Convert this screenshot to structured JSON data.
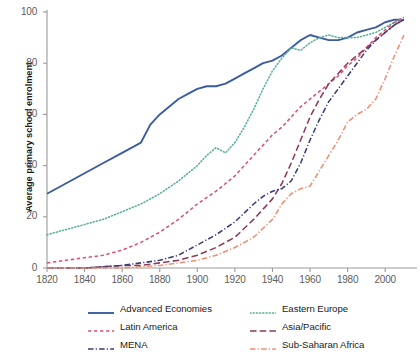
{
  "chart_data": {
    "type": "line",
    "title": "",
    "xlabel": "",
    "ylabel": "Average primary school enrolment",
    "xlim": [
      1820,
      2010
    ],
    "ylim": [
      0,
      100
    ],
    "grid": false,
    "legend_position": "bottom",
    "xticks": [
      "1820",
      "1840",
      "1860",
      "1880",
      "1900",
      "1920",
      "1940",
      "1960",
      "1980",
      "2000"
    ],
    "xtick_values": [
      1820,
      1840,
      1860,
      1880,
      1900,
      1920,
      1940,
      1960,
      1980,
      2000
    ],
    "yticks": [
      "0",
      "20",
      "40",
      "60",
      "80",
      "100"
    ],
    "ytick_values": [
      0,
      20,
      40,
      60,
      80,
      100
    ],
    "series": [
      {
        "name": "Advanced Economies",
        "color": "#3b5c9e",
        "style": "solid",
        "x": [
          1820,
          1830,
          1840,
          1850,
          1860,
          1870,
          1875,
          1880,
          1885,
          1890,
          1895,
          1900,
          1905,
          1910,
          1915,
          1920,
          1925,
          1930,
          1935,
          1940,
          1945,
          1950,
          1955,
          1960,
          1965,
          1970,
          1975,
          1980,
          1985,
          1990,
          1995,
          2000,
          2005,
          2010
        ],
        "values": [
          29,
          33,
          37,
          41,
          45,
          49,
          56,
          60,
          63,
          66,
          68,
          70,
          71,
          71,
          72,
          74,
          76,
          78,
          80,
          81,
          83,
          86,
          89,
          91,
          90,
          89,
          89,
          90,
          92,
          93,
          94,
          96,
          97,
          97
        ]
      },
      {
        "name": "Eastern Europe",
        "color": "#58b09c",
        "style": "dotted",
        "x": [
          1820,
          1830,
          1840,
          1850,
          1860,
          1870,
          1880,
          1890,
          1900,
          1905,
          1910,
          1915,
          1920,
          1925,
          1930,
          1935,
          1940,
          1945,
          1950,
          1955,
          1960,
          1965,
          1970,
          1975,
          1980,
          1985,
          1990,
          1995,
          2000,
          2005,
          2010
        ],
        "values": [
          13,
          15,
          17,
          19,
          22,
          25,
          29,
          34,
          40,
          44,
          47,
          45,
          49,
          55,
          62,
          70,
          77,
          82,
          86,
          85,
          88,
          90,
          91,
          90,
          90,
          90,
          91,
          92,
          94,
          96,
          97
        ]
      },
      {
        "name": "Latin America",
        "color": "#d9536f",
        "style": "dashed",
        "x": [
          1820,
          1830,
          1840,
          1850,
          1860,
          1870,
          1880,
          1890,
          1900,
          1910,
          1920,
          1925,
          1930,
          1935,
          1940,
          1945,
          1950,
          1955,
          1960,
          1965,
          1970,
          1975,
          1980,
          1985,
          1990,
          1995,
          2000,
          2005,
          2010
        ],
        "values": [
          2,
          3,
          4,
          5,
          7,
          10,
          14,
          19,
          25,
          30,
          36,
          40,
          44,
          48,
          52,
          55,
          59,
          63,
          66,
          69,
          72,
          75,
          79,
          82,
          86,
          90,
          93,
          96,
          98
        ]
      },
      {
        "name": "Asia/Pacific",
        "color": "#8c3a5c",
        "style": "longdash",
        "x": [
          1820,
          1840,
          1860,
          1870,
          1880,
          1890,
          1900,
          1910,
          1920,
          1930,
          1935,
          1940,
          1945,
          1950,
          1955,
          1960,
          1965,
          1970,
          1975,
          1980,
          1985,
          1990,
          1995,
          2000,
          2005,
          2010
        ],
        "values": [
          0,
          0,
          1,
          1,
          2,
          3,
          5,
          8,
          12,
          19,
          23,
          27,
          33,
          41,
          50,
          59,
          66,
          72,
          76,
          80,
          83,
          86,
          89,
          92,
          95,
          97
        ]
      },
      {
        "name": "MENA",
        "color": "#3c3c78",
        "style": "dashdot",
        "x": [
          1820,
          1840,
          1860,
          1870,
          1880,
          1890,
          1900,
          1910,
          1920,
          1930,
          1935,
          1940,
          1945,
          1950,
          1955,
          1960,
          1965,
          1970,
          1975,
          1980,
          1985,
          1990,
          1995,
          2000,
          2005,
          2010
        ],
        "values": [
          0,
          0,
          1,
          2,
          3,
          5,
          9,
          13,
          18,
          25,
          28,
          30,
          31,
          34,
          41,
          50,
          58,
          65,
          70,
          75,
          80,
          85,
          89,
          92,
          95,
          97
        ]
      },
      {
        "name": "Sub-Saharan Africa",
        "color": "#ef8e72",
        "style": "dashdot",
        "x": [
          1820,
          1840,
          1860,
          1880,
          1890,
          1900,
          1910,
          1920,
          1930,
          1940,
          1945,
          1950,
          1955,
          1960,
          1965,
          1970,
          1975,
          1980,
          1985,
          1990,
          1995,
          2000,
          2005,
          2010
        ],
        "values": [
          0,
          0,
          0,
          1,
          2,
          3,
          5,
          8,
          12,
          19,
          25,
          29,
          31,
          32,
          38,
          44,
          50,
          57,
          60,
          62,
          66,
          74,
          83,
          91
        ]
      }
    ]
  },
  "axis": {
    "y_label": "Average primary school enrolment",
    "y_ticks": [
      "100",
      "80",
      "60",
      "40",
      "20",
      "0"
    ],
    "x_ticks": [
      "1820",
      "1840",
      "1860",
      "1880",
      "1900",
      "1920",
      "1940",
      "1960",
      "1980",
      "2000"
    ]
  },
  "legend": {
    "entries": [
      {
        "label": "Advanced Economies",
        "color": "#3b5c9e",
        "style": "solid"
      },
      {
        "label": "Eastern Europe",
        "color": "#58b09c",
        "style": "dotted"
      },
      {
        "label": "Latin America",
        "color": "#d9536f",
        "style": "dashed"
      },
      {
        "label": "Asia/Pacific",
        "color": "#8c3a5c",
        "style": "longdash"
      },
      {
        "label": "MENA",
        "color": "#3c3c78",
        "style": "dashdot"
      },
      {
        "label": "Sub-Saharan Africa",
        "color": "#ef8e72",
        "style": "dashdot"
      }
    ]
  }
}
